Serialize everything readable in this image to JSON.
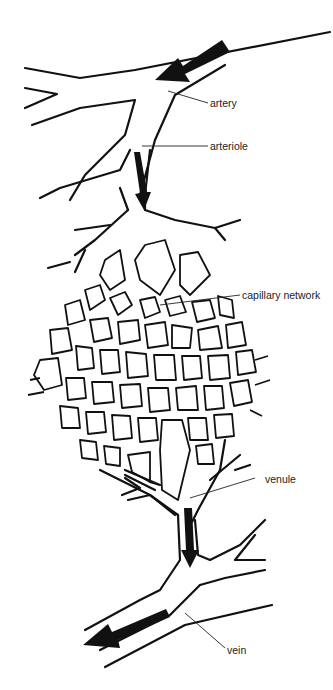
{
  "diagram": {
    "labels": {
      "artery": "artery",
      "arteriole": "arteriole",
      "capillary_network": "capillary network",
      "venule": "venule",
      "vein": "vein"
    },
    "flow_arrows": [
      {
        "position": "artery",
        "direction": "down-left"
      },
      {
        "position": "arteriole",
        "direction": "down"
      },
      {
        "position": "venule",
        "direction": "down"
      },
      {
        "position": "vein",
        "direction": "down-left"
      }
    ],
    "colors": {
      "ink": "#111111",
      "background": "#ffffff"
    }
  }
}
